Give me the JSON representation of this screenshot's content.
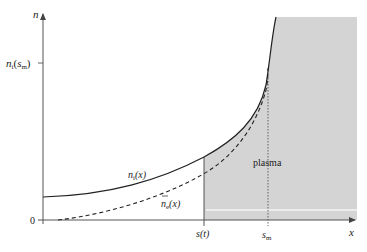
{
  "diagram": {
    "type": "density-profile",
    "axes": {
      "y_label": "n",
      "x_label": "x",
      "origin_label": "0",
      "y_tick": {
        "base": "n",
        "sub": "i",
        "arg": "s",
        "arg_sub": "m"
      },
      "x_ticks": [
        {
          "text": "s(t)"
        },
        {
          "base": "s",
          "sub": "m"
        }
      ]
    },
    "curves": [
      {
        "name": "ion-density",
        "base": "n",
        "sub": "i",
        "arg": "(x)",
        "style": "solid"
      },
      {
        "name": "electron-density",
        "base": "n",
        "sub": "e",
        "arg": "(x)",
        "overbar": true,
        "style": "dashed"
      }
    ],
    "region_label": "plasma",
    "colors": {
      "axis": "#555555",
      "curve": "#222222",
      "shade": "#d4d4d4",
      "inner_line": "#f2f2f2"
    }
  }
}
